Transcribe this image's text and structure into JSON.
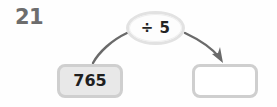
{
  "problem": {
    "number": "21",
    "type": "function-machine",
    "operation": "÷ 5",
    "operation_icon": "division-sign",
    "input_value": "765",
    "answer_value": "",
    "answer_placeholder": ""
  },
  "connectors": {
    "input_to_operation": {
      "name": "curve-input-to-operation",
      "has_arrowhead": false
    },
    "operation_to_answer": {
      "name": "arrow-operation-to-answer",
      "has_arrowhead": true
    }
  },
  "colors": {
    "background": "#fefefe",
    "number_text": "#6d6d6d",
    "value_text": "#1f1f1f",
    "box_border": "#cfcfcf",
    "input_box_fill": "#e8e8e8",
    "answer_box_fill": "#ffffff",
    "bubble_border": "#e2e2e2",
    "bubble_fill": "#fdfdfd",
    "connector_stroke": "#6a6a6a"
  }
}
